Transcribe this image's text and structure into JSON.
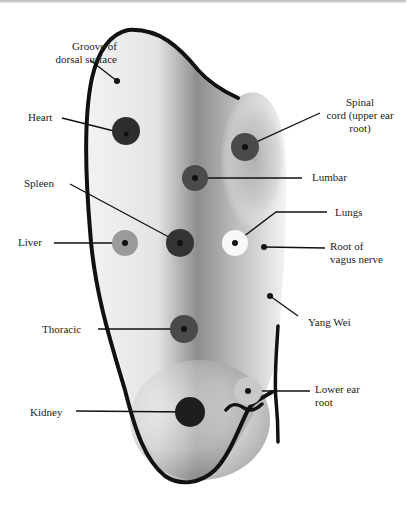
{
  "colors": {
    "outline": "#111111",
    "dot_dark": "#2e2e2e",
    "dot_medium": "#4a4a4a",
    "dot_light": "#9a9a9a",
    "dot_white": "#f8f8f8",
    "text": "#222222"
  },
  "labels": {
    "groove": [
      "Groove of",
      "dorsal surface"
    ],
    "heart": "Heart",
    "spinal_cord": [
      "Spinal",
      "cord (upper ear",
      "root)"
    ],
    "lumbar": "Lumbar",
    "spleen": "Spleen",
    "lungs": "Lungs",
    "liver": "Liver",
    "vagus": [
      "Root of",
      "vagus nerve"
    ],
    "yang_wei": "Yang Wei",
    "thoracic": "Thoracic",
    "lower_ear_root": [
      "Lower ear",
      "root"
    ],
    "kidney": "Kidney"
  },
  "points": [
    {
      "name": "Groove of dorsal surface",
      "x": 117,
      "y": 81,
      "r": 3,
      "fill": "none"
    },
    {
      "name": "Heart",
      "x": 126,
      "y": 131,
      "r": 14,
      "fill": "dark"
    },
    {
      "name": "Spinal cord (upper ear root)",
      "x": 245,
      "y": 147,
      "r": 14,
      "fill": "medium"
    },
    {
      "name": "Lumbar",
      "x": 195,
      "y": 178,
      "r": 13,
      "fill": "medium"
    },
    {
      "name": "Spleen",
      "x": 180,
      "y": 243,
      "r": 14,
      "fill": "dark"
    },
    {
      "name": "Liver",
      "x": 125,
      "y": 243,
      "r": 13,
      "fill": "light"
    },
    {
      "name": "Lungs",
      "x": 235,
      "y": 243,
      "r": 13,
      "fill": "white"
    },
    {
      "name": "Root of vagus nerve",
      "x": 264,
      "y": 247,
      "r": 3,
      "fill": "none"
    },
    {
      "name": "Yang Wei",
      "x": 270,
      "y": 296,
      "r": 3,
      "fill": "none"
    },
    {
      "name": "Thoracic",
      "x": 184,
      "y": 329,
      "r": 14,
      "fill": "medium"
    },
    {
      "name": "Lower ear root",
      "x": 248,
      "y": 391,
      "r": 14,
      "fill": "light"
    },
    {
      "name": "Kidney",
      "x": 190,
      "y": 412,
      "r": 15,
      "fill": "black"
    }
  ]
}
